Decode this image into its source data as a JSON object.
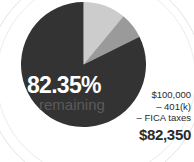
{
  "figure": {
    "pie_label_value": "82.35%",
    "pie_label_caption": "remaining"
  },
  "calculation": {
    "gross": "$100,000",
    "deduction_retirement": "– 401(k)",
    "deduction_tax": "– FICA taxes",
    "total": "$82,350"
  },
  "colors": {
    "remaining": "#333333",
    "retirement": "#cccccc",
    "fica": "#9a9a9a",
    "background": "#ffffff",
    "value_text": "#ffffff",
    "caption_text": "#5a5a5a",
    "calc_text": "#2b2b2b",
    "arc_guide": "#e3e3e3"
  },
  "chart_data": {
    "type": "pie",
    "title": "82.35% remaining",
    "categories": [
      "401(k)",
      "FICA taxes",
      "remaining"
    ],
    "values": [
      11.0,
      6.65,
      82.35
    ],
    "labels": [
      "11%",
      "6.65%",
      "82.35%"
    ],
    "colors": [
      "#cccccc",
      "#9a9a9a",
      "#333333"
    ],
    "units": "percent",
    "start_angle_deg": 0,
    "direction": "clockwise",
    "legend": "none",
    "grid": false,
    "annotations": [
      "$100,000",
      "– 401(k)",
      "– FICA taxes",
      "$82,350"
    ]
  }
}
